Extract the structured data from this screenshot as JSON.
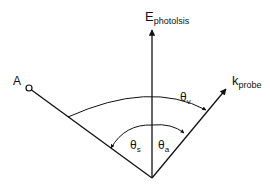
{
  "diagram": {
    "labels": {
      "e_main": "E",
      "e_sub": "photolsis",
      "k_main": "k",
      "k_sub": "probe",
      "point_a": "A",
      "theta_v_main": "θ",
      "theta_v_sub": "v",
      "theta_s_main": "θ",
      "theta_s_sub": "s",
      "theta_a_main": "θ",
      "theta_a_sub": "a"
    },
    "colors": {
      "line": "#111111",
      "background": "#ffffff"
    }
  }
}
